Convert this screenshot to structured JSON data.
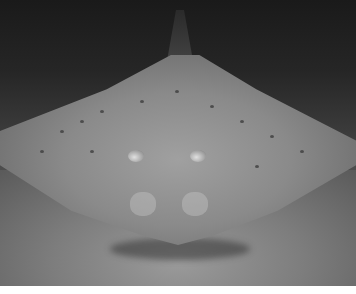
{
  "image": {
    "subject": "underwater photo of a spotted ray resting on sandy seafloor",
    "colors": {
      "background_water": "#1a1a1a",
      "ray_body": "#8a8a8a",
      "sand": "#7d7d7d",
      "bottom_margin": "#ffffff"
    }
  }
}
